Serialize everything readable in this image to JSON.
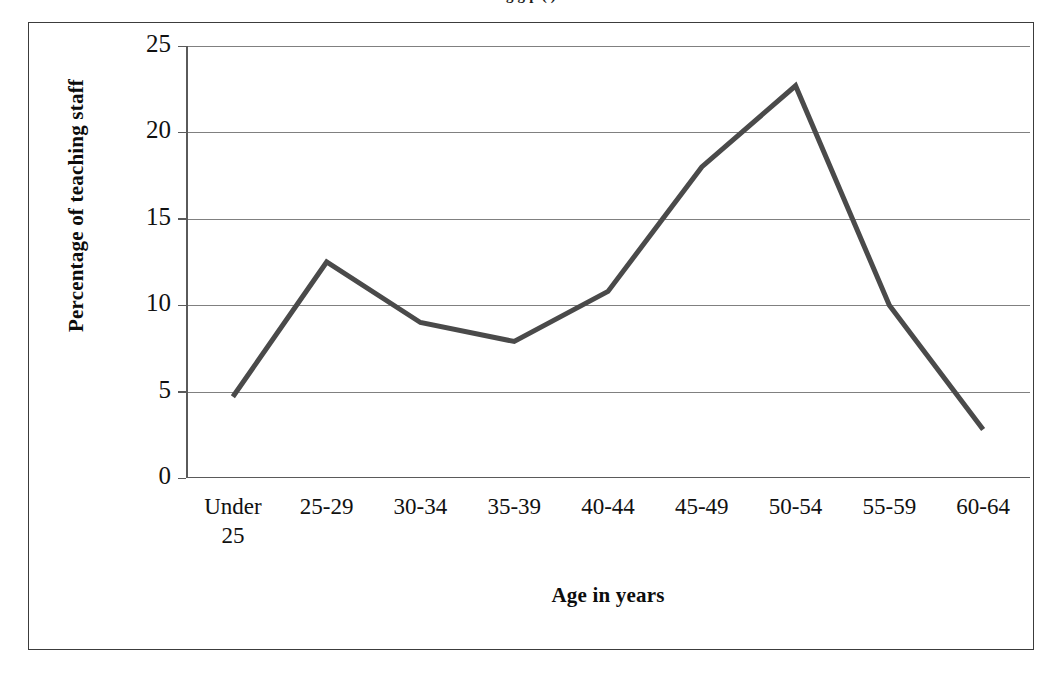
{
  "caption": {
    "partial_text_above_frame": "g g p ( )"
  },
  "chart_data": {
    "type": "line",
    "title": "",
    "xlabel": "Age in years",
    "ylabel": "Percentage of teaching staff",
    "categories": [
      "Under 25",
      "25-29",
      "30-34",
      "35-39",
      "40-44",
      "45-49",
      "50-54",
      "55-59",
      "60-64"
    ],
    "category_lines": [
      [
        "Under",
        "25"
      ],
      [
        "25-29"
      ],
      [
        "30-34"
      ],
      [
        "35-39"
      ],
      [
        "40-44"
      ],
      [
        "45-49"
      ],
      [
        "50-54"
      ],
      [
        "55-59"
      ],
      [
        "60-64"
      ]
    ],
    "values": [
      4.7,
      12.5,
      9.0,
      7.9,
      10.8,
      18.0,
      22.7,
      10.0,
      2.8
    ],
    "ylim": [
      0,
      25
    ],
    "yticks": [
      0,
      5,
      10,
      15,
      20,
      25
    ],
    "ytick_labels": [
      "0",
      "5",
      "10",
      "15",
      "20",
      "25"
    ],
    "grid": true,
    "grid_axis": "y",
    "legend": false,
    "legend_position": "none",
    "series": [
      {
        "name": "Percentage of teaching staff",
        "values": [
          4.7,
          12.5,
          9.0,
          7.9,
          10.8,
          18.0,
          22.7,
          10.0,
          2.8
        ],
        "color": "#4a4a4a",
        "line_width": 5,
        "markers": false
      }
    ]
  },
  "style": {
    "line_color": "#4a4a4a",
    "grid_color": "#808080",
    "axis_color": "#5a5a5a",
    "frame_color": "#3c3c3c",
    "text_color": "#111111",
    "background": "#ffffff"
  }
}
